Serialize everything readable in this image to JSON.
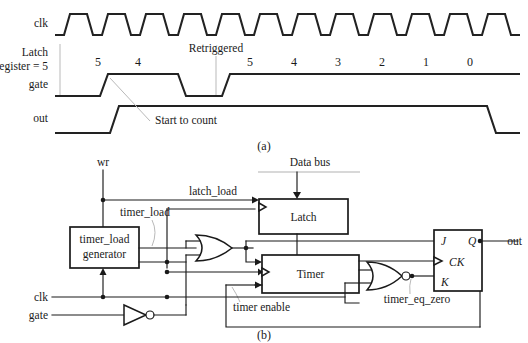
{
  "figure": {
    "panel_a_caption": "(a)",
    "panel_b_caption": "(b)"
  },
  "timing": {
    "signals": {
      "clk": "clk",
      "latch_line1": "Latch",
      "latch_line2": "register = 5",
      "gate": "gate",
      "out": "out"
    },
    "annotations": {
      "retriggered": "Retriggered",
      "start_to_count": "Start to count"
    },
    "count_values_first": [
      "5",
      "4"
    ],
    "count_values_second": [
      "5",
      "4",
      "3",
      "2",
      "1",
      "0"
    ],
    "clock_pulses": 12
  },
  "blockdiagram": {
    "inputs": {
      "wr": "wr",
      "clk": "clk",
      "gate": "gate",
      "data_bus": "Data bus"
    },
    "outputs": {
      "out": "out"
    },
    "blocks": [
      {
        "name": "timer_load_generator",
        "line1": "timer_load",
        "line2": "generator"
      },
      {
        "name": "latch",
        "label": "Latch"
      },
      {
        "name": "timer",
        "label": "Timer"
      }
    ],
    "flipflop": {
      "j": "J",
      "q": "Q",
      "ck": "CK",
      "k": "K"
    },
    "net_labels": {
      "latch_load": "latch_load",
      "timer_load": "timer_load",
      "timer_enable": "timer enable",
      "timer_eq_zero": "timer_eq_zero"
    }
  },
  "colors": {
    "ink": "#1a1a1a",
    "wave": "#222222",
    "leader": "#b9b9b9",
    "bus_shadow": "#d8d8d8",
    "background": "#ffffff"
  }
}
